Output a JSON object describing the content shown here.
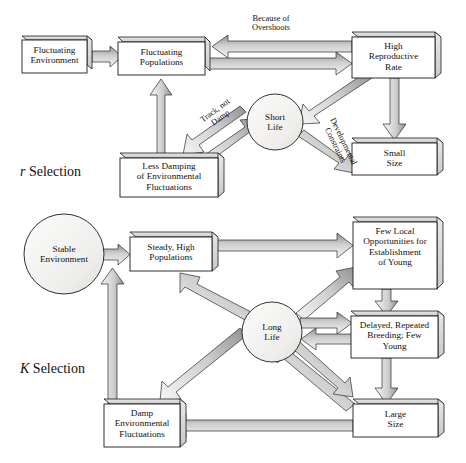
{
  "figure": {
    "type": "concept-diagram",
    "sections": [
      {
        "id": "r",
        "label_italic": "r",
        "label_rest": " Selection"
      },
      {
        "id": "K",
        "label_italic": "K",
        "label_rest": " Selection"
      }
    ]
  },
  "r_selection": {
    "section_label_italic": "r",
    "section_label_rest": " Selection",
    "nodes": [
      {
        "id": "fluct-env",
        "shape": "box",
        "lines": [
          "Fluctuating",
          "Environment"
        ]
      },
      {
        "id": "fluct-pop",
        "shape": "box",
        "lines": [
          "Fluctuating",
          "Populations"
        ]
      },
      {
        "id": "high-repro",
        "shape": "box",
        "lines": [
          "High",
          "Reproductive",
          "Rate"
        ]
      },
      {
        "id": "short-life",
        "shape": "circle",
        "lines": [
          "Short",
          "Life"
        ]
      },
      {
        "id": "less-damp",
        "shape": "box",
        "lines": [
          "Less Damping",
          "of Environmental",
          "Fluctuations"
        ]
      },
      {
        "id": "small-size",
        "shape": "box",
        "lines": [
          "Small",
          "Size"
        ]
      }
    ],
    "edge_labels": [
      {
        "id": "because-of-overshoots",
        "lines": [
          "Because of",
          "Overshoots"
        ],
        "rotation": 0
      },
      {
        "id": "track-not-damp",
        "lines": [
          "Track, not",
          "Damp"
        ],
        "rotation": -36
      },
      {
        "id": "developmental-constraints",
        "lines": [
          "Developmental",
          "Constraints"
        ],
        "rotation": 64
      }
    ]
  },
  "k_selection": {
    "section_label_italic": "K",
    "section_label_rest": " Selection",
    "nodes": [
      {
        "id": "stable-env",
        "shape": "circle",
        "lines": [
          "Stable",
          "Environment"
        ]
      },
      {
        "id": "steady-pop",
        "shape": "box",
        "lines": [
          "Steady, High",
          "Populations"
        ]
      },
      {
        "id": "few-local",
        "shape": "box",
        "lines": [
          "Few Local",
          "Opportunities for",
          "Establishment",
          "of Young"
        ]
      },
      {
        "id": "long-life",
        "shape": "circle",
        "lines": [
          "Long",
          "Life"
        ]
      },
      {
        "id": "delayed-rep",
        "shape": "box",
        "lines": [
          "Delayed, Repeated",
          "Breeding; Few",
          "Young"
        ]
      },
      {
        "id": "large-size",
        "shape": "box",
        "lines": [
          "Large",
          "Size"
        ]
      },
      {
        "id": "damp-env",
        "shape": "box",
        "lines": [
          "Damp",
          "Environmental",
          "Fluctuations"
        ]
      }
    ],
    "edge_labels": []
  },
  "colors": {
    "outline": "#1a1a1a",
    "box_fill": "#ffffff",
    "box_side": "#d9d9d9",
    "arrow_light": "#f2f2f2",
    "arrow_mid": "#c4c4c4",
    "arrow_dark": "#8c8c8c",
    "circle_fill": "#f0efed",
    "text": "#111111"
  }
}
